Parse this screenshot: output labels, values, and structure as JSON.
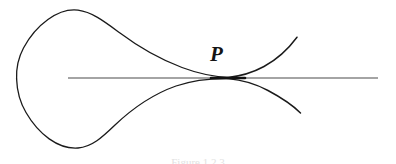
{
  "figure": {
    "domain": "Diagram",
    "kind": "mathematical-curve-diagram",
    "background_color": "#ffffff",
    "ink_color": "#1a1a1a",
    "axis_color": "#4a4a4a",
    "label_color": "#141414",
    "point_label": "P",
    "caption_fragment": "Figure   1.2.3",
    "canvas": {
      "width": 396,
      "height": 164
    }
  },
  "geometry": {
    "axis_line": {
      "name": "horizontal-tangent-line",
      "x_start": 68,
      "x_end": 378,
      "y": 78,
      "stroke_width": 1.1
    },
    "tacnode_point": {
      "x": 228,
      "y": 78
    },
    "loop": {
      "leftmost_x": 17,
      "top_y": 10,
      "bottom_y": 148,
      "center_x": 78,
      "center_y": 79
    },
    "upper_branch_end": {
      "x": 297,
      "y": 37
    },
    "lower_branch_end": {
      "x": 300,
      "y": 113
    },
    "curve_stroke_width": 1.3,
    "node_thickening_half_width": 17
  },
  "paths": {
    "upper_curve": "M 228 77.4 C 214 76.6 198 73.5 182 67.5 C 160 59.2 136 45.0 120 33.0 C 104 21.2 92 12.0 78 10.2 C 58 7.8 36 25.0 23.5 48.0 C 17.5 59.2 16.2 69.0 16.6 79.0",
    "lower_curve": "M 16.6 79.0 C 17.0 90.5 19.5 101.5 26.0 112.5 C 38.5 134.0 58.0 149.5 78.0 148.0 C 92.0 146.8 102.0 137.5 115.0 125.0 C 131.0 109.8 152.0 94.5 176.0 86.0 C 194.0 79.8 212.0 78.4 228.0 78.6",
    "upper_right_branch": "M 228 77.4 C 240 76.2 252 73.0 264 66.5 C 278 58.8 289 48.0 297 37.2",
    "lower_right_branch": "M 228 78.6 C 242 79.8 255 83.5 268 90.5 C 283 98.5 294 106.5 300.5 113.0"
  },
  "annotations": {
    "point_label_position": {
      "x": 210,
      "y": 44
    },
    "caption_position": {
      "x": 198,
      "y": 158,
      "align": "center"
    }
  }
}
